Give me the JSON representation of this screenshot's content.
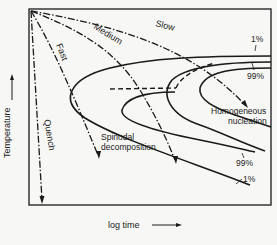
{
  "diagram": {
    "type": "TTT diagram (time-temperature-transformation)",
    "axes": {
      "x_label": "log time",
      "y_label": "Temperature"
    },
    "cooling_paths": [
      {
        "name": "Quench",
        "label": "Quench"
      },
      {
        "name": "Fast",
        "label": "Fast"
      },
      {
        "name": "Medium",
        "label": "Medium"
      },
      {
        "name": "Slow",
        "label": "Slow"
      }
    ],
    "regions": {
      "spinodal": "Spinodal decomposition",
      "spinodal_line1": "Spinodal",
      "spinodal_line2": "decomposition",
      "homogeneous_line1": "Homogeneous",
      "homogeneous_line2": "nucleation"
    },
    "curve_labels": {
      "top_1pct": "1%",
      "top_99pct": "99%",
      "bottom_99pct": "99%",
      "bottom_1pct": "1%"
    }
  }
}
